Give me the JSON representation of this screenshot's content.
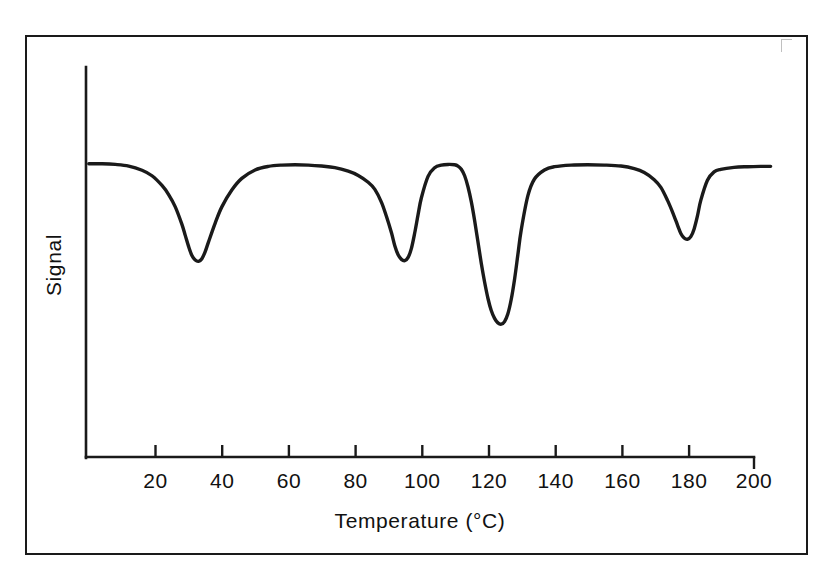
{
  "figure": {
    "background_color": "#ffffff",
    "line_color": "#1a1a1a",
    "frame_color": "#1a1a1a"
  },
  "axes": {
    "x_title": "Temperature (°C)",
    "y_title": "Signal",
    "x_ticks": [
      "20",
      "40",
      "60",
      "80",
      "100",
      "120",
      "140",
      "160",
      "180",
      "200"
    ],
    "y_ticks": []
  },
  "chart_data": {
    "type": "line",
    "title": "",
    "subtitle": "",
    "xlabel": "Temperature (°C)",
    "ylabel": "Signal",
    "xlim": [
      0,
      205
    ],
    "ylim": [
      0,
      1
    ],
    "grid": false,
    "legend": null,
    "axis_style": "x-axis-only-with-ticks, y-axis-unlabeled-vertical-spine",
    "series": [
      {
        "name": "Signal trace",
        "x": [
          0,
          4,
          8,
          12,
          16,
          19,
          22,
          24,
          26,
          28,
          29,
          30,
          31,
          32,
          33,
          34,
          35,
          36,
          38,
          40,
          43,
          46,
          50,
          54,
          58,
          62,
          66,
          70,
          74,
          78,
          81,
          84,
          86,
          88,
          89.5,
          91,
          92,
          93,
          94,
          95,
          96,
          97,
          98,
          99,
          100,
          102,
          104,
          106,
          108,
          110,
          111,
          112,
          113,
          114,
          115,
          116,
          117,
          118,
          119,
          120,
          121,
          122,
          123,
          124,
          125,
          126,
          127,
          128,
          129,
          130,
          132,
          134,
          137,
          140,
          145,
          150,
          155,
          160,
          164,
          167,
          170,
          172,
          174,
          175.5,
          177,
          178,
          179,
          180,
          181,
          182,
          183,
          184,
          186,
          188,
          190,
          194,
          198,
          202,
          205
        ],
        "y": [
          0.905,
          0.905,
          0.903,
          0.898,
          0.885,
          0.868,
          0.838,
          0.81,
          0.772,
          0.718,
          0.684,
          0.65,
          0.622,
          0.608,
          0.604,
          0.612,
          0.634,
          0.664,
          0.722,
          0.772,
          0.824,
          0.86,
          0.886,
          0.897,
          0.901,
          0.902,
          0.901,
          0.898,
          0.893,
          0.882,
          0.869,
          0.848,
          0.826,
          0.786,
          0.742,
          0.692,
          0.652,
          0.624,
          0.61,
          0.606,
          0.616,
          0.644,
          0.692,
          0.748,
          0.8,
          0.866,
          0.893,
          0.901,
          0.903,
          0.902,
          0.898,
          0.888,
          0.868,
          0.834,
          0.788,
          0.73,
          0.664,
          0.598,
          0.54,
          0.49,
          0.452,
          0.428,
          0.414,
          0.41,
          0.418,
          0.442,
          0.486,
          0.548,
          0.624,
          0.7,
          0.806,
          0.858,
          0.886,
          0.896,
          0.901,
          0.902,
          0.901,
          0.898,
          0.89,
          0.878,
          0.856,
          0.832,
          0.792,
          0.756,
          0.716,
          0.69,
          0.676,
          0.672,
          0.68,
          0.704,
          0.744,
          0.792,
          0.854,
          0.88,
          0.888,
          0.894,
          0.896,
          0.897,
          0.897
        ]
      }
    ],
    "peaks": [
      {
        "label": "peak-1",
        "temperature_c": 31,
        "relative_depth": 0.604
      },
      {
        "label": "peak-2",
        "temperature_c": 94,
        "relative_depth": 0.606
      },
      {
        "label": "peak-3",
        "temperature_c": 124,
        "relative_depth": 0.41
      },
      {
        "label": "peak-4",
        "temperature_c": 180,
        "relative_depth": 0.672
      }
    ]
  }
}
